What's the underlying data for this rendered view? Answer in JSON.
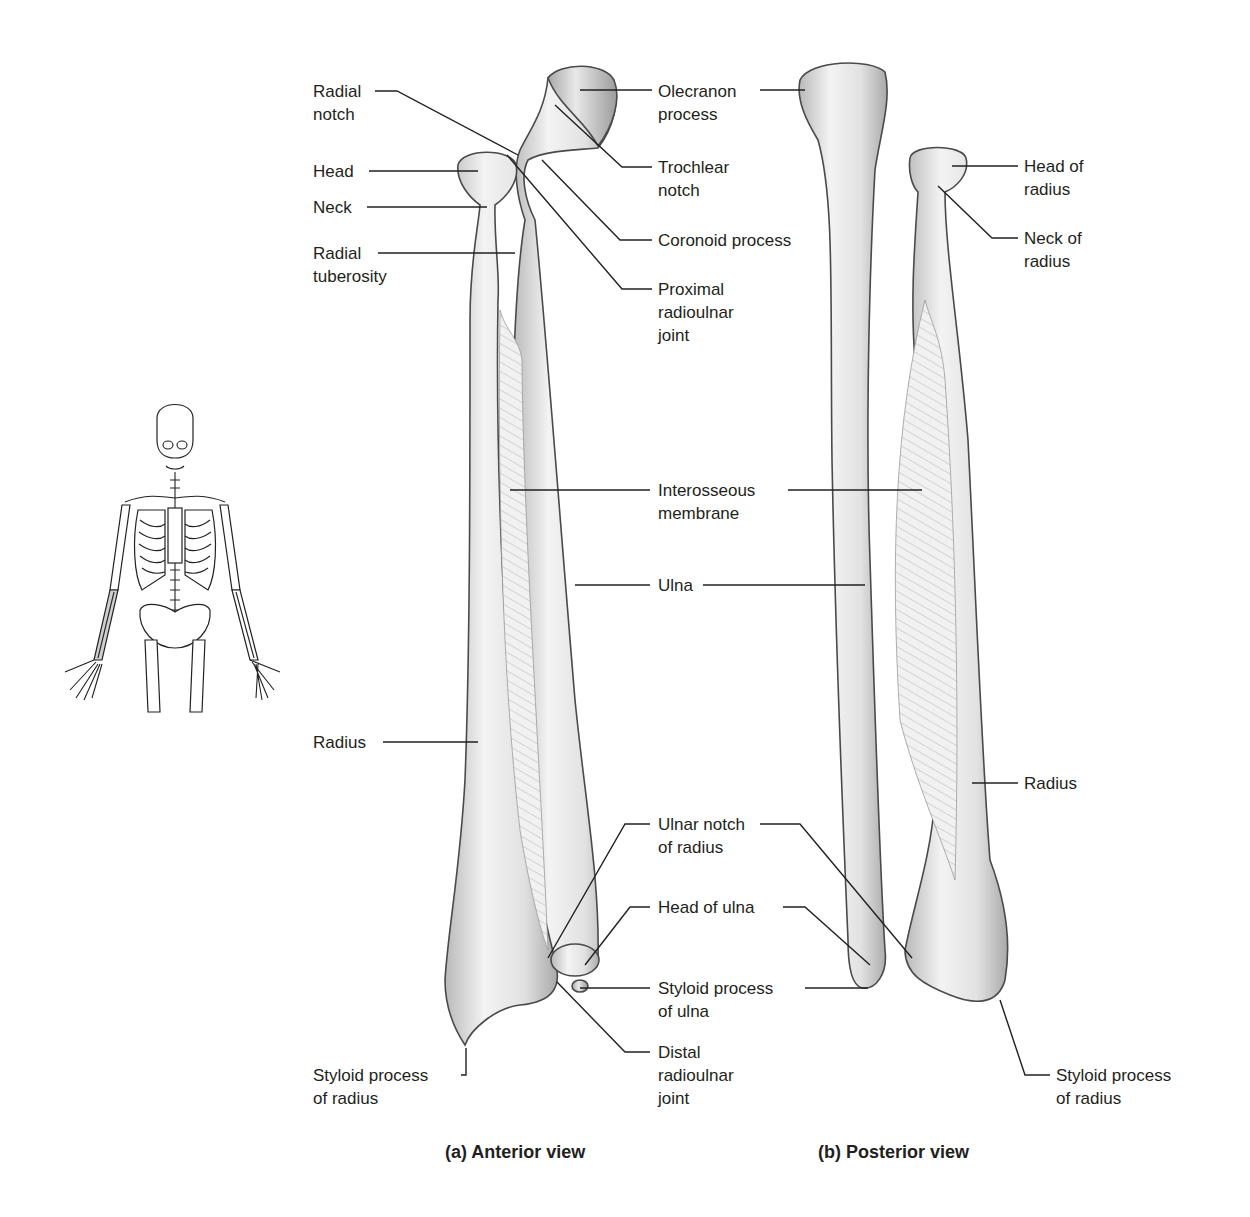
{
  "figure": {
    "orientation_thumbnail": {
      "description": "Skeleton figure with right forearm (radius and ulna) highlighted",
      "highlight_color": "#cfcfcf"
    },
    "views": [
      {
        "caption": "(a) Anterior view",
        "labels": {
          "radial_notch": [
            "Radial",
            "notch"
          ],
          "head": [
            "Head"
          ],
          "neck": [
            "Neck"
          ],
          "radial_tuberosity": [
            "Radial",
            "tuberosity"
          ],
          "radius": [
            "Radius"
          ],
          "styloid_process_of_radius": [
            "Styloid process",
            "of radius"
          ],
          "olecranon_process": [
            "Olecranon",
            "process"
          ],
          "trochlear_notch": [
            "Trochlear",
            "notch"
          ],
          "coronoid_process": [
            "Coronoid process"
          ],
          "proximal_radioulnar_joint": [
            "Proximal",
            "radioulnar",
            "joint"
          ],
          "distal_radioulnar_joint": [
            "Distal",
            "radioulnar",
            "joint"
          ]
        }
      },
      {
        "caption": "(b) Posterior view",
        "labels": {
          "head_of_radius": [
            "Head of",
            "radius"
          ],
          "neck_of_radius": [
            "Neck of",
            "radius"
          ],
          "radius": [
            "Radius"
          ],
          "styloid_process_of_radius": [
            "Styloid process",
            "of radius"
          ]
        }
      }
    ],
    "shared_labels": {
      "interosseous_membrane": [
        "Interosseous",
        "membrane"
      ],
      "ulna": [
        "Ulna"
      ],
      "ulnar_notch_of_radius": [
        "Ulnar notch",
        "of radius"
      ],
      "head_of_ulna": [
        "Head of ulna"
      ],
      "styloid_process_of_ulna": [
        "Styloid process",
        "of ulna"
      ]
    },
    "colors": {
      "text": "#231f20",
      "bone_light": "#f2f2f2",
      "bone_shadow": "#bdbdbd",
      "background": "#ffffff"
    }
  }
}
